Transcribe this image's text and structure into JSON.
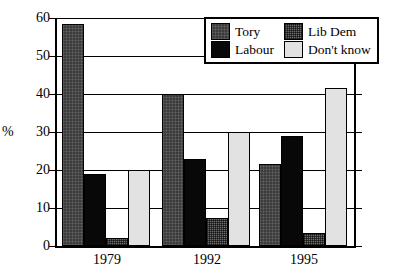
{
  "chart_data": {
    "type": "bar",
    "title": "",
    "xlabel": "",
    "ylabel": "%",
    "categories": [
      "1979",
      "1992",
      "1995"
    ],
    "series": [
      {
        "name": "Tory",
        "values": [
          58.5,
          40.0,
          21.5
        ],
        "color": "#3b3b3b",
        "pattern": "dark-textured"
      },
      {
        "name": "Labour",
        "values": [
          19.0,
          23.0,
          29.0
        ],
        "color": "#080808",
        "pattern": "solid-black"
      },
      {
        "name": "Lib Dem",
        "values": [
          2.0,
          7.5,
          3.5
        ],
        "color": "#6e6e6e",
        "pattern": "checkered-gray"
      },
      {
        "name": "Don't know",
        "values": [
          20.0,
          30.0,
          41.5
        ],
        "color": "#e2e2e2",
        "pattern": "light-gray"
      }
    ],
    "ylim": [
      0,
      60
    ],
    "yticks": [
      0,
      10,
      20,
      30,
      40,
      50,
      60
    ],
    "ytick_labels": [
      "0",
      "10",
      "20",
      "30",
      "40",
      "50",
      "60"
    ],
    "grid": true,
    "grid_axis": "y",
    "legend_position": "top-right",
    "right_axis_ticks": true
  },
  "axis": {
    "y_unit_label": "%",
    "tick_labels": [
      "60",
      "50",
      "40",
      "30",
      "20",
      "10",
      "0"
    ]
  },
  "legend": {
    "items": [
      {
        "label": "Tory",
        "swatch": "tory-swatch"
      },
      {
        "label": "Lib Dem",
        "swatch": "libdem-swatch"
      },
      {
        "label": "Labour",
        "swatch": "labour-swatch"
      },
      {
        "label": "Don't know",
        "swatch": "dontknow-swatch"
      }
    ]
  }
}
